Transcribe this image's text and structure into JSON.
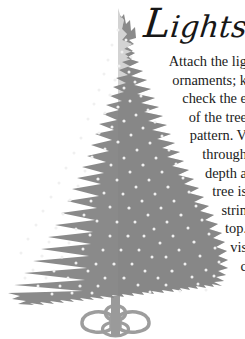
{
  "page": {
    "background_color": "#ffffff",
    "width": 245,
    "height": 339
  },
  "article": {
    "title": "Lights",
    "title_color": "#171717",
    "body_color": "#1b1b1b",
    "note": "Body text is right-aligned and clipped by the page edge; each visible line is recorded exactly as rendered.",
    "lines": [
      "Attach the lig",
      "ornaments; k",
      "check the e",
      "of the tree",
      "pattern. V",
      "through",
      "depth a",
      "tree is",
      "strin",
      "top.",
      "vis",
      "c"
    ]
  },
  "illustration": {
    "name": "christmas-tree",
    "tree_color": "#8a8a8a",
    "tree_shadow_color": "#7e7e7e",
    "light_color": "#f2f2f2",
    "stand_color": "#9a9a9a",
    "stand_outline_color": "#8c8c8c",
    "apex": {
      "x": 118,
      "y": 8
    },
    "widest": {
      "left": 8,
      "right": 222,
      "y": 288
    },
    "base_y": 306,
    "lights_count": 96
  }
}
